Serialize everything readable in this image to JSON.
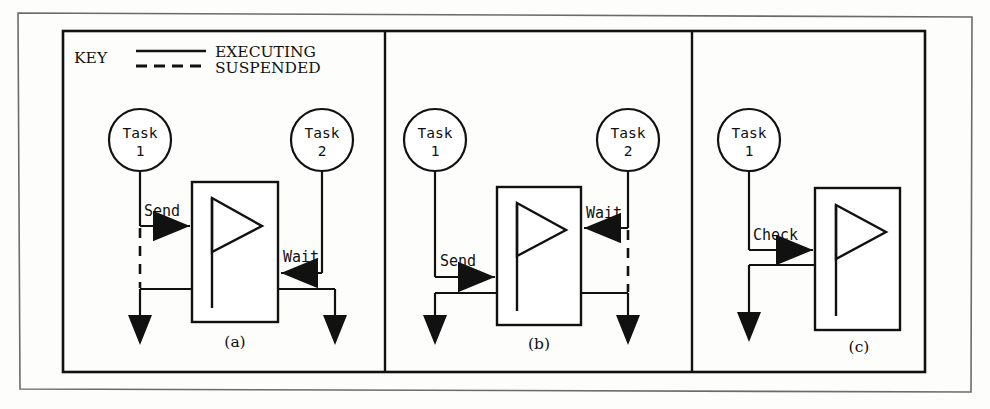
{
  "figure": {
    "legend": {
      "heading": "KEY",
      "entries": [
        {
          "label": "EXECUTING",
          "style": "solid"
        },
        {
          "label": "SUSPENDED",
          "style": "dashed"
        }
      ]
    },
    "panels": [
      {
        "id": "a",
        "caption": "(a)",
        "symbol": "flag-icon",
        "tasks": [
          {
            "name_line1": "Task",
            "name_line2": "1",
            "side": "left",
            "state": "suspended"
          },
          {
            "name_line1": "Task",
            "name_line2": "2",
            "side": "right",
            "state": "executing"
          }
        ],
        "operations": [
          {
            "label": "Send",
            "from": "Task 1",
            "direction": "right"
          },
          {
            "label": "Wait",
            "from": "Task 2",
            "direction": "left"
          }
        ]
      },
      {
        "id": "b",
        "caption": "(b)",
        "symbol": "flag-icon",
        "tasks": [
          {
            "name_line1": "Task",
            "name_line2": "1",
            "side": "left",
            "state": "executing"
          },
          {
            "name_line1": "Task",
            "name_line2": "2",
            "side": "right",
            "state": "suspended"
          }
        ],
        "operations": [
          {
            "label": "Send",
            "from": "Task 1",
            "direction": "right"
          },
          {
            "label": "Wait",
            "from": "Task 2",
            "direction": "left"
          }
        ]
      },
      {
        "id": "c",
        "caption": "(c)",
        "symbol": "flag-icon",
        "tasks": [
          {
            "name_line1": "Task",
            "name_line2": "1",
            "side": "left",
            "state": "executing"
          }
        ],
        "operations": [
          {
            "label": "Check",
            "from": "Task 1",
            "direction": "right"
          }
        ]
      }
    ],
    "colors": {
      "ink": "#111111",
      "paper": "#fdfdfc",
      "frame": "#555555"
    }
  },
  "labels": {
    "key_heading": "KEY",
    "executing": "EXECUTING",
    "suspended": "SUSPENDED",
    "task_word": "Task",
    "task_1_num": "1",
    "task_2_num": "2",
    "send": "Send",
    "wait": "Wait",
    "check": "Check",
    "cap_a": "(a)",
    "cap_b": "(b)",
    "cap_c": "(c)"
  }
}
